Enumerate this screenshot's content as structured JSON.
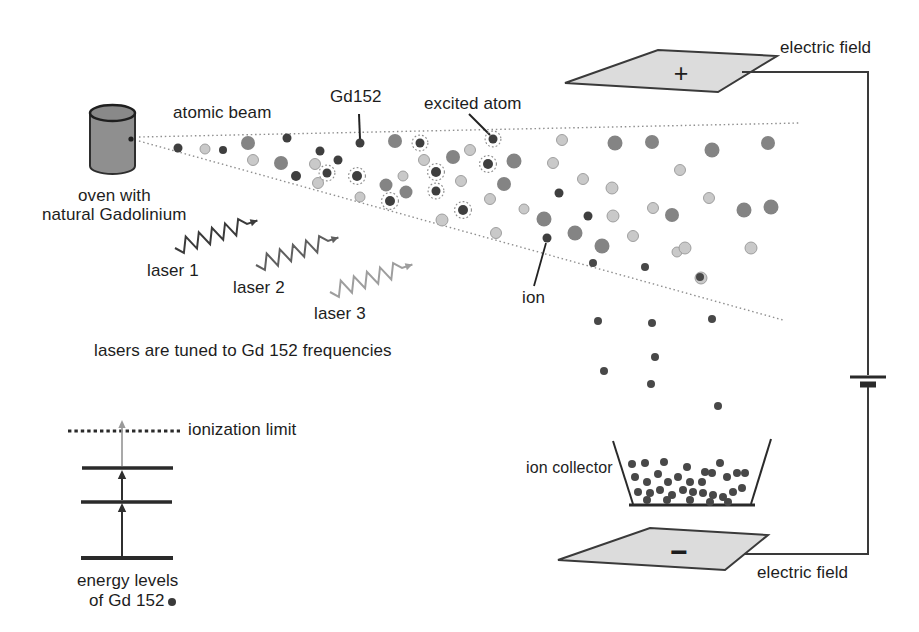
{
  "figure": {
    "title_hint": "laser isotope separation of Gd 152",
    "labels": {
      "atomic_beam": "atomic beam",
      "gd152": "Gd152",
      "excited_atom": "excited atom",
      "electric_field_top": "electric field",
      "electric_field_bottom": "electric field",
      "oven_line1": "oven with",
      "oven_line2": "natural Gadolinium",
      "laser1": "laser 1",
      "laser2": "laser 2",
      "laser3": "laser 3",
      "lasers_tuned": "lasers are tuned to Gd 152 frequencies",
      "ion": "ion",
      "ion_collector": "ion collector",
      "ionization_limit": "ionization limit",
      "energy_levels_line1": "energy levels",
      "energy_levels_line2": "of Gd 152",
      "plate_top_sign": "+",
      "plate_bottom_sign": "−"
    },
    "colors": {
      "text": "#1d1d1d",
      "outline": "#3a3a3a",
      "plate_fill": "#dcdcdc",
      "oven_fill": "#8f8f8f",
      "beam_line": "#8f8f8f",
      "atom_gray": "#848484",
      "atom_light_fill": "#c9c9c9",
      "atom_light_edge": "#979797",
      "atom_dark": "#3f3f3f",
      "excited_halo": "#8a8a8a",
      "ion_dot": "#484848",
      "laser1": "#3b3b3b",
      "laser2": "#606060",
      "laser3": "#9e9e9e",
      "energy_arrow_dark": "#2f2f2f",
      "energy_arrow_gray": "#9a9a9a"
    },
    "lasers": [
      {
        "name": "laser-1",
        "x1": 175,
        "y1": 248,
        "x2": 247,
        "y2": 224,
        "color_key": "laser1"
      },
      {
        "name": "laser-2",
        "x1": 256,
        "y1": 265,
        "x2": 328,
        "y2": 241,
        "color_key": "laser2"
      },
      {
        "name": "laser-3",
        "x1": 330,
        "y1": 292,
        "x2": 402,
        "y2": 268,
        "color_key": "laser3"
      }
    ],
    "atoms": [
      {
        "x": 178,
        "y": 148,
        "r": 4.5,
        "t": "dark"
      },
      {
        "x": 205,
        "y": 149,
        "r": 5,
        "t": "light"
      },
      {
        "x": 223,
        "y": 150,
        "r": 4,
        "t": "dark"
      },
      {
        "x": 248,
        "y": 143,
        "r": 7,
        "t": "gray"
      },
      {
        "x": 253,
        "y": 160,
        "r": 5.5,
        "t": "light"
      },
      {
        "x": 287,
        "y": 138,
        "r": 4.5,
        "t": "dark"
      },
      {
        "x": 281,
        "y": 163,
        "r": 7,
        "t": "gray"
      },
      {
        "x": 296,
        "y": 176,
        "r": 5,
        "t": "dark"
      },
      {
        "x": 320,
        "y": 151,
        "r": 4.5,
        "t": "dark"
      },
      {
        "x": 315,
        "y": 164,
        "r": 5.5,
        "t": "light"
      },
      {
        "x": 327,
        "y": 173,
        "r": 4.5,
        "t": "excited"
      },
      {
        "x": 318,
        "y": 183,
        "r": 5.5,
        "t": "light"
      },
      {
        "x": 338,
        "y": 160,
        "r": 4.5,
        "t": "dark"
      },
      {
        "x": 360,
        "y": 143,
        "r": 4.5,
        "t": "dark"
      },
      {
        "x": 357,
        "y": 176,
        "r": 5,
        "t": "excited"
      },
      {
        "x": 360,
        "y": 197,
        "r": 5,
        "t": "light"
      },
      {
        "x": 386,
        "y": 185,
        "r": 6.5,
        "t": "gray"
      },
      {
        "x": 390,
        "y": 201,
        "r": 5,
        "t": "excited"
      },
      {
        "x": 395,
        "y": 141,
        "r": 7,
        "t": "gray"
      },
      {
        "x": 406,
        "y": 192,
        "r": 6.5,
        "t": "gray"
      },
      {
        "x": 403,
        "y": 176,
        "r": 5,
        "t": "light"
      },
      {
        "x": 420,
        "y": 143,
        "r": 4.5,
        "t": "excited"
      },
      {
        "x": 424,
        "y": 160,
        "r": 5.5,
        "t": "light"
      },
      {
        "x": 436,
        "y": 172,
        "r": 5,
        "t": "excited"
      },
      {
        "x": 453,
        "y": 157,
        "r": 7,
        "t": "gray"
      },
      {
        "x": 470,
        "y": 150,
        "r": 5.5,
        "t": "light"
      },
      {
        "x": 493,
        "y": 139,
        "r": 4.5,
        "t": "excited"
      },
      {
        "x": 488,
        "y": 164,
        "r": 5,
        "t": "excited"
      },
      {
        "x": 514,
        "y": 161,
        "r": 7.5,
        "t": "gray"
      },
      {
        "x": 504,
        "y": 184,
        "r": 7,
        "t": "gray"
      },
      {
        "x": 436,
        "y": 191,
        "r": 4.5,
        "t": "excited"
      },
      {
        "x": 461,
        "y": 181,
        "r": 5.5,
        "t": "light"
      },
      {
        "x": 490,
        "y": 199,
        "r": 5.5,
        "t": "light"
      },
      {
        "x": 463,
        "y": 210,
        "r": 5,
        "t": "excited"
      },
      {
        "x": 442,
        "y": 220,
        "r": 6,
        "t": "light"
      },
      {
        "x": 496,
        "y": 233,
        "r": 5.5,
        "t": "light"
      },
      {
        "x": 524,
        "y": 209,
        "r": 5,
        "t": "light"
      },
      {
        "x": 562,
        "y": 140,
        "r": 5.5,
        "t": "light"
      },
      {
        "x": 553,
        "y": 163,
        "r": 5.5,
        "t": "light"
      },
      {
        "x": 583,
        "y": 179,
        "r": 5.5,
        "t": "light"
      },
      {
        "x": 559,
        "y": 193,
        "r": 4.5,
        "t": "dark"
      },
      {
        "x": 544,
        "y": 219,
        "r": 7.5,
        "t": "gray"
      },
      {
        "x": 575,
        "y": 233,
        "r": 7.5,
        "t": "gray"
      },
      {
        "x": 588,
        "y": 216,
        "r": 4.5,
        "t": "dark"
      },
      {
        "x": 602,
        "y": 246,
        "r": 7.5,
        "t": "gray"
      },
      {
        "x": 615,
        "y": 143,
        "r": 7.5,
        "t": "gray"
      },
      {
        "x": 612,
        "y": 188,
        "r": 6,
        "t": "light"
      },
      {
        "x": 613,
        "y": 216,
        "r": 6,
        "t": "light"
      },
      {
        "x": 652,
        "y": 142,
        "r": 7,
        "t": "gray"
      },
      {
        "x": 653,
        "y": 208,
        "r": 5.5,
        "t": "light"
      },
      {
        "x": 672,
        "y": 215,
        "r": 7,
        "t": "gray"
      },
      {
        "x": 633,
        "y": 236,
        "r": 5.5,
        "t": "light"
      },
      {
        "x": 547,
        "y": 238,
        "r": 4.5,
        "t": "dark"
      },
      {
        "x": 677,
        "y": 252,
        "r": 5,
        "t": "light"
      },
      {
        "x": 680,
        "y": 170,
        "r": 5.5,
        "t": "light"
      },
      {
        "x": 712,
        "y": 150,
        "r": 7.5,
        "t": "gray"
      },
      {
        "x": 768,
        "y": 143,
        "r": 7,
        "t": "gray"
      },
      {
        "x": 709,
        "y": 198,
        "r": 5.5,
        "t": "light"
      },
      {
        "x": 744,
        "y": 210,
        "r": 7.5,
        "t": "gray"
      },
      {
        "x": 771,
        "y": 207,
        "r": 7.5,
        "t": "gray"
      },
      {
        "x": 685,
        "y": 248,
        "r": 6,
        "t": "light"
      },
      {
        "x": 751,
        "y": 248,
        "r": 6,
        "t": "light"
      },
      {
        "x": 701,
        "y": 278,
        "r": 6,
        "t": "light"
      }
    ],
    "falling_ions": [
      {
        "x": 593,
        "y": 263
      },
      {
        "x": 645,
        "y": 267
      },
      {
        "x": 700,
        "y": 277
      },
      {
        "x": 598,
        "y": 321
      },
      {
        "x": 652,
        "y": 323
      },
      {
        "x": 712,
        "y": 319
      },
      {
        "x": 655,
        "y": 357
      },
      {
        "x": 604,
        "y": 371
      },
      {
        "x": 651,
        "y": 384
      },
      {
        "x": 718,
        "y": 406
      }
    ],
    "collector_ions": [
      {
        "x": 632,
        "y": 464
      },
      {
        "x": 645,
        "y": 463
      },
      {
        "x": 664,
        "y": 462
      },
      {
        "x": 687,
        "y": 467
      },
      {
        "x": 705,
        "y": 472
      },
      {
        "x": 720,
        "y": 463
      },
      {
        "x": 635,
        "y": 477
      },
      {
        "x": 647,
        "y": 482
      },
      {
        "x": 658,
        "y": 474
      },
      {
        "x": 668,
        "y": 482
      },
      {
        "x": 678,
        "y": 477
      },
      {
        "x": 690,
        "y": 482
      },
      {
        "x": 702,
        "y": 482
      },
      {
        "x": 712,
        "y": 473
      },
      {
        "x": 727,
        "y": 477
      },
      {
        "x": 737,
        "y": 473
      },
      {
        "x": 745,
        "y": 473
      },
      {
        "x": 638,
        "y": 492
      },
      {
        "x": 650,
        "y": 493
      },
      {
        "x": 660,
        "y": 490
      },
      {
        "x": 672,
        "y": 495
      },
      {
        "x": 683,
        "y": 490
      },
      {
        "x": 693,
        "y": 492
      },
      {
        "x": 703,
        "y": 493
      },
      {
        "x": 713,
        "y": 495
      },
      {
        "x": 723,
        "y": 497
      },
      {
        "x": 733,
        "y": 492
      },
      {
        "x": 742,
        "y": 488
      },
      {
        "x": 647,
        "y": 500
      },
      {
        "x": 667,
        "y": 500
      },
      {
        "x": 690,
        "y": 500
      },
      {
        "x": 710,
        "y": 502
      },
      {
        "x": 728,
        "y": 502
      }
    ]
  }
}
